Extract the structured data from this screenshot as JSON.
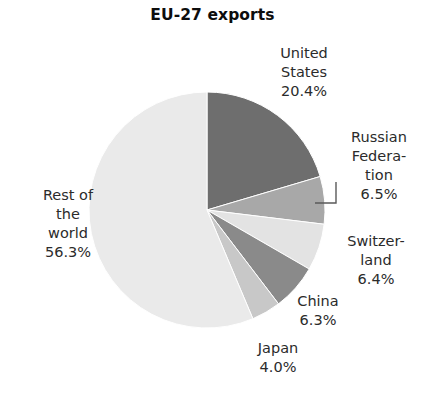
{
  "chart_data": {
    "type": "pie",
    "title": "EU-27 exports",
    "xlabel": "",
    "ylabel": "",
    "unit": "%",
    "legend": "none",
    "grid": false,
    "start_angle_deg": 0,
    "direction": "clockwise",
    "categories": [
      "United States",
      "Russian Federation",
      "Switzerland",
      "China",
      "Japan",
      "Rest of the world"
    ],
    "values": [
      20.4,
      6.5,
      6.4,
      6.3,
      4.0,
      56.3
    ],
    "slices": [
      {
        "name": "United States",
        "value": 20.4,
        "value_text": "20.4%",
        "color": "#6e6e6e",
        "label_lines": [
          "United",
          "States",
          "20.4%"
        ],
        "leader_line": false
      },
      {
        "name": "Russian Federation",
        "value": 6.5,
        "value_text": "6.5%",
        "color": "#a8a8a8",
        "label_lines": [
          "Russian",
          "Federa-",
          "tion",
          "6.5%"
        ],
        "leader_line": true
      },
      {
        "name": "Switzerland",
        "value": 6.4,
        "value_text": "6.4%",
        "color": "#e3e3e3",
        "label_lines": [
          "Switzer-",
          "land",
          "6.4%"
        ],
        "leader_line": false
      },
      {
        "name": "China",
        "value": 6.3,
        "value_text": "6.3%",
        "color": "#8a8a8a",
        "label_lines": [
          "China",
          "6.3%"
        ],
        "leader_line": false
      },
      {
        "name": "Japan",
        "value": 4.0,
        "value_text": "4.0%",
        "color": "#c8c8c8",
        "label_lines": [
          "Japan",
          "4.0%"
        ],
        "leader_line": false
      },
      {
        "name": "Rest of the world",
        "value": 56.3,
        "value_text": "56.3%",
        "color": "#eaeaea",
        "label_lines": [
          "Rest of",
          "the",
          "world",
          "56.3%"
        ],
        "leader_line": false
      }
    ],
    "geometry": {
      "center_x": 207,
      "center_y": 210,
      "radius": 118
    },
    "colors": {
      "background": "#ffffff",
      "text": "#2b2b2b",
      "title_text": "#0d0d0d",
      "slice_outline": "#ffffff",
      "leader_line": "#5a5a5a"
    }
  }
}
